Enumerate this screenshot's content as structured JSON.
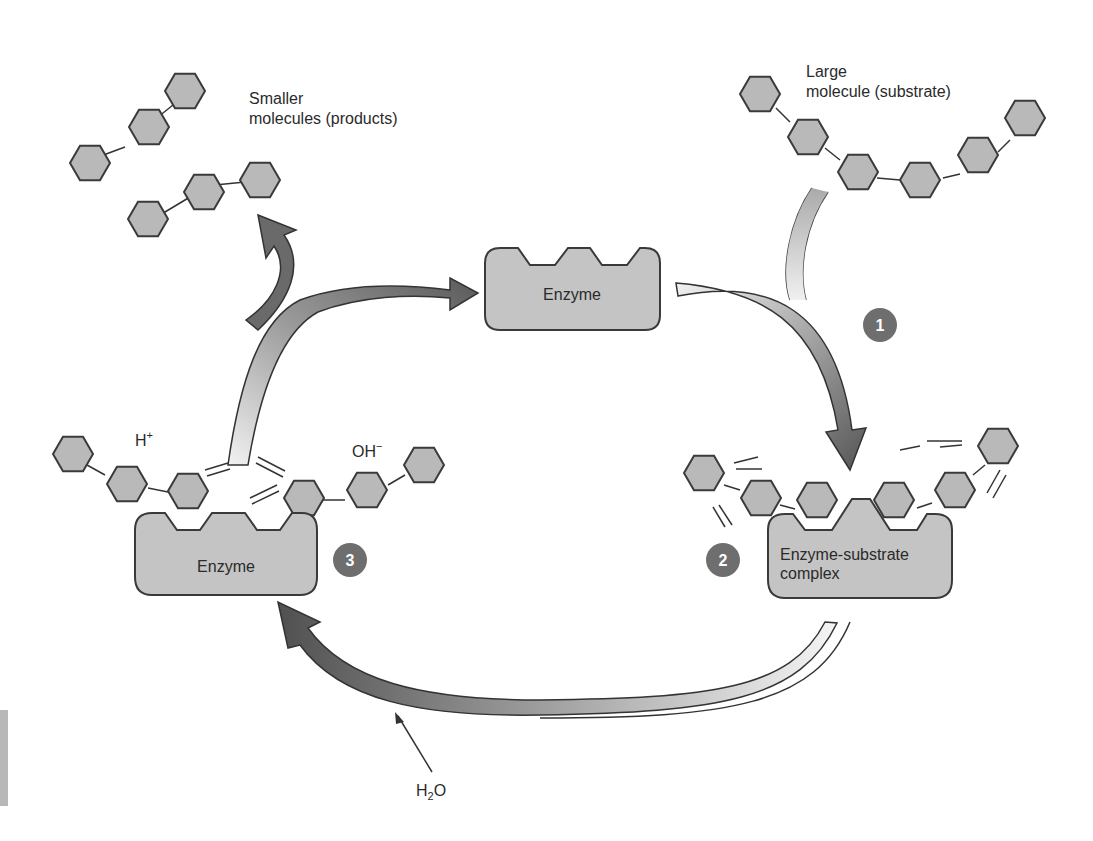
{
  "diagram": {
    "labels": {
      "products": [
        "Smaller",
        "molecules (products)"
      ],
      "substrate": [
        "Large",
        "molecule (substrate)"
      ],
      "enzyme_top": "Enzyme",
      "enzyme_left": "Enzyme",
      "complex": [
        "Enzyme-substrate",
        "complex"
      ],
      "h_plus": "H",
      "h_plus_sup": "+",
      "oh_minus": "OH",
      "oh_minus_sup": "−",
      "water_main": "H",
      "water_sub": "2",
      "water_end": "O"
    },
    "steps": [
      {
        "number": "1",
        "description": "Substrate binds to enzyme"
      },
      {
        "number": "2",
        "description": "Enzyme-substrate complex forms"
      },
      {
        "number": "3",
        "description": "Hydrolysis releases products; enzyme reused"
      }
    ],
    "colors": {
      "molecule_fill": "#b9b9b9",
      "molecule_stroke": "#3a3a3a",
      "enzyme_fill": "#c4c4c4",
      "step_badge": "#6e6e6e",
      "arrow_dark": "#555555",
      "arrow_light": "#f0f0f0"
    }
  }
}
